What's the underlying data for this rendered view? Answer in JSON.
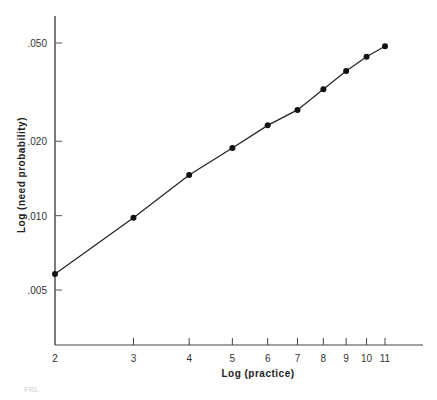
{
  "chart_data": {
    "type": "line",
    "title": "",
    "xlabel": "Log (practice)",
    "ylabel": "Log (need probability)",
    "x_scale": "log",
    "y_scale": "log",
    "x_ticks": [
      "2",
      "3",
      "4",
      "5",
      "6",
      "7",
      "8",
      "9",
      "10",
      "11"
    ],
    "y_ticks": [
      ".005",
      ".010",
      ".020",
      ".050"
    ],
    "x": [
      2,
      3,
      4,
      5,
      6,
      7,
      8,
      9,
      10,
      11
    ],
    "series": [
      {
        "name": "need probability",
        "values": [
          0.0058,
          0.0098,
          0.0146,
          0.0188,
          0.0232,
          0.0268,
          0.0325,
          0.0385,
          0.044,
          0.0485
        ]
      }
    ],
    "xlim": [
      2,
      13
    ],
    "ylim": [
      0.003,
      0.066
    ],
    "grid": false,
    "legend": "none",
    "markers": "filled-circle"
  },
  "caption": {
    "text": "FIG."
  }
}
